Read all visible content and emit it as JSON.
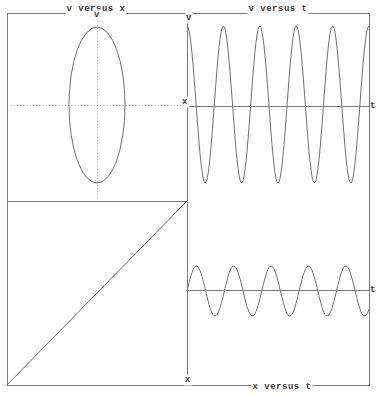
{
  "figure": {
    "width": 378,
    "height": 397,
    "colors": {
      "background": "#ffffff",
      "frame_line": "#7b7b7b",
      "curve_line": "#6f6f6f",
      "dotted_line": "#a8a8a8",
      "text": "#3d3d3d"
    }
  },
  "labels": {
    "top_left_title": "v versus x",
    "top_right_title": "v versus t",
    "bottom_right_title": "x versus t",
    "v_left": "v",
    "x_left": "x",
    "v_right": "v",
    "t_top": "t",
    "t_bottom": "t",
    "x_bottom": "x"
  },
  "frame": {
    "outer": [
      7,
      13,
      369,
      385
    ],
    "divider_x": 187,
    "divider_y": [
      13,
      380
    ],
    "left_split_y": 201,
    "left_split_x": [
      7,
      187
    ]
  },
  "chart_data": [
    {
      "id": "phase_plot",
      "type": "line",
      "title": "v versus x",
      "xlabel": "x",
      "ylabel": "v",
      "shape": "ellipse",
      "description": "Phase-space trajectory of simple harmonic motion: closed ellipse centered on dotted crosshair axes; no tick labels",
      "center_px": {
        "cx": 97,
        "cy": 105
      },
      "x_amplitude_px": 28,
      "v_amplitude_px": 78,
      "dotted_v_axis": {
        "x": 97,
        "y1": 21,
        "y2": 198
      },
      "dotted_h_axis": {
        "y": 105,
        "x1": 10,
        "x2": 181
      },
      "grid": false
    },
    {
      "id": "v_vs_t",
      "type": "line",
      "title": "v versus t",
      "xlabel": "t",
      "ylabel": "v",
      "waveform": "cosine",
      "cycles": 5,
      "start_phase": "maximum",
      "amplitude_px": 78.5,
      "center_y": 104.5,
      "t_axis_y": 106,
      "x_range_px": [
        187,
        369
      ],
      "grid": false
    },
    {
      "id": "x_vs_t",
      "type": "line",
      "title": "x versus t",
      "xlabel": "t",
      "ylabel": "x",
      "waveform": "sine",
      "cycles": 4.87,
      "start_phase": "zero-rising",
      "amplitude_px": 25,
      "center_y": 291,
      "t_axis_y": 290,
      "x_range_px": [
        187,
        369
      ],
      "grid": false
    },
    {
      "id": "reference_diagonal",
      "type": "line",
      "description": "45-degree construction line in the empty lower-left panel linking the x axis of the x-versus-t plot to the x axis of the v-versus-x plot",
      "from_px": [
        7,
        385
      ],
      "to_px": [
        187,
        201
      ]
    }
  ]
}
